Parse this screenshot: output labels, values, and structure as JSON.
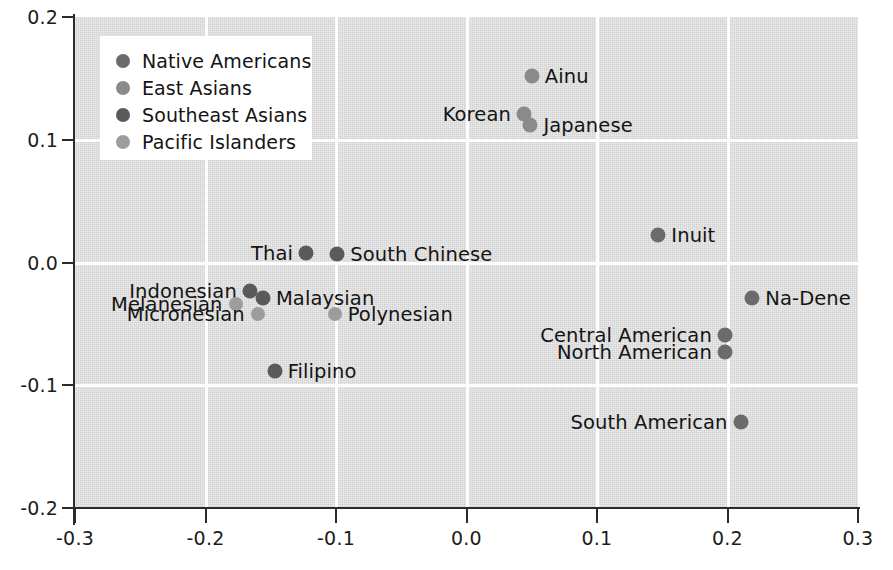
{
  "chart_data": {
    "type": "scatter",
    "title": "",
    "xlabel": "",
    "ylabel": "",
    "xlim": [
      -0.3,
      0.3
    ],
    "ylim": [
      -0.2,
      0.2
    ],
    "xticks": [
      "-0.3",
      "-0.2",
      "-0.1",
      "0.0",
      "0.1",
      "0.2",
      "0.3"
    ],
    "yticks": [
      "0.2",
      "0.1",
      "0.0",
      "-0.1",
      "-0.2"
    ],
    "grid": true,
    "legend_position": "upper left",
    "series": [
      {
        "name": "Native Americans",
        "color": "#6b6b6b"
      },
      {
        "name": "East Asians",
        "color": "#8a8a8a"
      },
      {
        "name": "Southeast Asians",
        "color": "#5a5a5a"
      },
      {
        "name": "Pacific Islanders",
        "color": "#9d9d9d"
      }
    ],
    "points": [
      {
        "label": "Ainu",
        "group": "East Asians",
        "x": 0.05,
        "y": 0.152,
        "label_side": "right"
      },
      {
        "label": "Korean",
        "group": "East Asians",
        "x": 0.044,
        "y": 0.121,
        "label_side": "left"
      },
      {
        "label": "Japanese",
        "group": "East Asians",
        "x": 0.049,
        "y": 0.112,
        "label_side": "right"
      },
      {
        "label": "Inuit",
        "group": "Native Americans",
        "x": 0.147,
        "y": 0.022,
        "label_side": "right"
      },
      {
        "label": "Na-Dene",
        "group": "Native Americans",
        "x": 0.219,
        "y": -0.029,
        "label_side": "right"
      },
      {
        "label": "Central American",
        "group": "Native Americans",
        "x": 0.198,
        "y": -0.059,
        "label_side": "left"
      },
      {
        "label": "North American",
        "group": "Native Americans",
        "x": 0.198,
        "y": -0.073,
        "label_side": "left"
      },
      {
        "label": "South American",
        "group": "Native Americans",
        "x": 0.21,
        "y": -0.13,
        "label_side": "left"
      },
      {
        "label": "Thai",
        "group": "Southeast Asians",
        "x": -0.123,
        "y": 0.008,
        "label_side": "left"
      },
      {
        "label": "South Chinese",
        "group": "Southeast Asians",
        "x": -0.099,
        "y": 0.007,
        "label_side": "right"
      },
      {
        "label": "Indonesian",
        "group": "Southeast Asians",
        "x": -0.166,
        "y": -0.023,
        "label_side": "left"
      },
      {
        "label": "Malaysian",
        "group": "Southeast Asians",
        "x": -0.156,
        "y": -0.029,
        "label_side": "right"
      },
      {
        "label": "Melanesian",
        "group": "Pacific Islanders",
        "x": -0.177,
        "y": -0.034,
        "label_side": "left"
      },
      {
        "label": "Micronesian",
        "group": "Pacific Islanders",
        "x": -0.16,
        "y": -0.042,
        "label_side": "left"
      },
      {
        "label": "Polynesian",
        "group": "Pacific Islanders",
        "x": -0.101,
        "y": -0.042,
        "label_side": "right"
      },
      {
        "label": "Filipino",
        "group": "Southeast Asians",
        "x": -0.147,
        "y": -0.088,
        "label_side": "right"
      }
    ]
  },
  "legend": {
    "items": [
      {
        "label": "Native Americans"
      },
      {
        "label": "East Asians"
      },
      {
        "label": "Southeast Asians"
      },
      {
        "label": "Pacific Islanders"
      }
    ]
  }
}
